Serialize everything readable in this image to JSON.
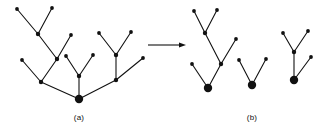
{
  "figure": {
    "type": "tree-decomposition-diagram",
    "background_color": "#ffffff",
    "stroke_color": "#111111",
    "node_color": "#111111",
    "edge_width": 1.1,
    "leaf_node_radius": 1.9,
    "internal_node_radius": 2.2,
    "root_node_radius": 4.2,
    "captions": [
      {
        "id": "caption-a",
        "text": "(a)",
        "x": 79,
        "y": 121
      },
      {
        "id": "caption-b",
        "text": "(b)",
        "x": 252,
        "y": 121
      }
    ],
    "arrow": {
      "name": "transformation-arrow",
      "x1": 148,
      "y1": 45,
      "x2": 186,
      "y2": 45,
      "head_length": 7,
      "head_width": 5
    },
    "panels": [
      {
        "id": "panel-a",
        "label": "(a)",
        "description": "single rooted tree before decomposition",
        "trees": [
          {
            "id": "tree-a-full",
            "root": [
              79,
              99
            ],
            "nodes": [
              {
                "id": "a-root",
                "x": 79,
                "y": 99,
                "kind": "root"
              },
              {
                "id": "a-n1",
                "x": 41,
                "y": 82,
                "kind": "internal"
              },
              {
                "id": "a-n2",
                "x": 57,
                "y": 59,
                "kind": "internal"
              },
              {
                "id": "a-n3",
                "x": 38,
                "y": 34,
                "kind": "internal"
              },
              {
                "id": "a-l1",
                "x": 17,
                "y": 9,
                "kind": "leaf"
              },
              {
                "id": "a-l2",
                "x": 52,
                "y": 8,
                "kind": "leaf"
              },
              {
                "id": "a-l3",
                "x": 71,
                "y": 35,
                "kind": "leaf"
              },
              {
                "id": "a-l4",
                "x": 22,
                "y": 60,
                "kind": "leaf"
              },
              {
                "id": "a-n4",
                "x": 79,
                "y": 76,
                "kind": "internal"
              },
              {
                "id": "a-l5",
                "x": 66,
                "y": 56,
                "kind": "leaf"
              },
              {
                "id": "a-l6",
                "x": 93,
                "y": 55,
                "kind": "leaf"
              },
              {
                "id": "a-n5",
                "x": 116,
                "y": 80,
                "kind": "internal"
              },
              {
                "id": "a-n6",
                "x": 116,
                "y": 55,
                "kind": "internal"
              },
              {
                "id": "a-l7",
                "x": 99,
                "y": 33,
                "kind": "leaf"
              },
              {
                "id": "a-l8",
                "x": 131,
                "y": 32,
                "kind": "leaf"
              },
              {
                "id": "a-l9",
                "x": 143,
                "y": 58,
                "kind": "leaf"
              }
            ],
            "edges": [
              [
                "a-root",
                "a-n1"
              ],
              [
                "a-n1",
                "a-n2"
              ],
              [
                "a-n2",
                "a-n3"
              ],
              [
                "a-n3",
                "a-l1"
              ],
              [
                "a-n3",
                "a-l2"
              ],
              [
                "a-n2",
                "a-l3"
              ],
              [
                "a-n1",
                "a-l4"
              ],
              [
                "a-root",
                "a-n4"
              ],
              [
                "a-n4",
                "a-l5"
              ],
              [
                "a-n4",
                "a-l6"
              ],
              [
                "a-root",
                "a-n5"
              ],
              [
                "a-n5",
                "a-n6"
              ],
              [
                "a-n6",
                "a-l7"
              ],
              [
                "a-n6",
                "a-l8"
              ],
              [
                "a-n5",
                "a-l9"
              ]
            ]
          }
        ]
      },
      {
        "id": "panel-b",
        "label": "(b)",
        "description": "three separate subtrees after decomposition",
        "trees": [
          {
            "id": "tree-b-left",
            "root": [
              208,
              88
            ],
            "nodes": [
              {
                "id": "b1-root",
                "x": 208,
                "y": 88,
                "kind": "root"
              },
              {
                "id": "b1-n1",
                "x": 221,
                "y": 64,
                "kind": "internal"
              },
              {
                "id": "b1-n2",
                "x": 205,
                "y": 33,
                "kind": "internal"
              },
              {
                "id": "b1-l1",
                "x": 194,
                "y": 11,
                "kind": "leaf"
              },
              {
                "id": "b1-l2",
                "x": 217,
                "y": 10,
                "kind": "leaf"
              },
              {
                "id": "b1-l3",
                "x": 236,
                "y": 39,
                "kind": "leaf"
              },
              {
                "id": "b1-l4",
                "x": 192,
                "y": 64,
                "kind": "leaf"
              }
            ],
            "edges": [
              [
                "b1-root",
                "b1-n1"
              ],
              [
                "b1-n1",
                "b1-n2"
              ],
              [
                "b1-n2",
                "b1-l1"
              ],
              [
                "b1-n2",
                "b1-l2"
              ],
              [
                "b1-n1",
                "b1-l3"
              ],
              [
                "b1-root",
                "b1-l4"
              ]
            ]
          },
          {
            "id": "tree-b-middle",
            "root": [
              252,
              85
            ],
            "nodes": [
              {
                "id": "b2-root",
                "x": 252,
                "y": 85,
                "kind": "root"
              },
              {
                "id": "b2-l1",
                "x": 239,
                "y": 60,
                "kind": "leaf"
              },
              {
                "id": "b2-l2",
                "x": 266,
                "y": 59,
                "kind": "leaf"
              }
            ],
            "edges": [
              [
                "b2-root",
                "b2-l1"
              ],
              [
                "b2-root",
                "b2-l2"
              ]
            ]
          },
          {
            "id": "tree-b-right",
            "root": [
              294,
              80
            ],
            "nodes": [
              {
                "id": "b3-root",
                "x": 294,
                "y": 80,
                "kind": "root"
              },
              {
                "id": "b3-n1",
                "x": 294,
                "y": 52,
                "kind": "internal"
              },
              {
                "id": "b3-l1",
                "x": 283,
                "y": 33,
                "kind": "leaf"
              },
              {
                "id": "b3-l2",
                "x": 308,
                "y": 31,
                "kind": "leaf"
              },
              {
                "id": "b3-l3",
                "x": 311,
                "y": 57,
                "kind": "leaf"
              }
            ],
            "edges": [
              [
                "b3-root",
                "b3-n1"
              ],
              [
                "b3-n1",
                "b3-l1"
              ],
              [
                "b3-n1",
                "b3-l2"
              ],
              [
                "b3-root",
                "b3-l3"
              ]
            ]
          }
        ]
      }
    ]
  }
}
